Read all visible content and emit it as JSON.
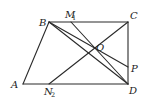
{
  "figure": {
    "points": {
      "A": {
        "label": "A",
        "sub": "",
        "x": 23,
        "y": 84
      },
      "B": {
        "label": "B",
        "sub": "",
        "x": 49,
        "y": 22
      },
      "C": {
        "label": "C",
        "sub": "",
        "x": 128,
        "y": 22
      },
      "D": {
        "label": "D",
        "sub": "",
        "x": 128,
        "y": 84
      },
      "M1": {
        "label": "M",
        "sub": "1",
        "x": 71,
        "y": 22
      },
      "N2": {
        "label": "N",
        "sub": "2",
        "x": 49,
        "y": 84
      },
      "O": {
        "label": "O",
        "sub": "",
        "x": 93,
        "y": 48
      },
      "P": {
        "label": "P",
        "sub": "",
        "x": 128,
        "y": 67
      }
    },
    "segments": [
      [
        "A",
        "B"
      ],
      [
        "B",
        "C"
      ],
      [
        "C",
        "D"
      ],
      [
        "A",
        "D"
      ],
      [
        "B",
        "D"
      ],
      [
        "C",
        "N2"
      ],
      [
        "M1",
        "D"
      ],
      [
        "B",
        "P"
      ]
    ],
    "line_color": "#2a2a2a"
  }
}
